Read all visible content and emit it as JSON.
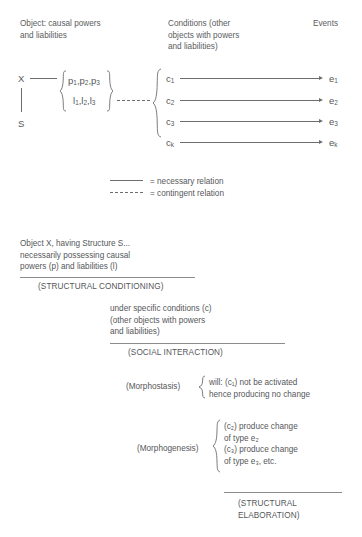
{
  "figure": {
    "headers": {
      "object": "Object: causal powers\nand liabilities",
      "conditions": "Conditions (other\nobjects with powers\nand liabilities)",
      "events": "Events"
    },
    "object_nodes": {
      "x": "X",
      "s": "S"
    },
    "powers_group": {
      "powers": [
        "p",
        "p",
        "p"
      ],
      "powers_subs": [
        "1",
        "2",
        "3"
      ],
      "liabilities": [
        "l",
        "l",
        "l"
      ],
      "liabilities_subs": [
        "1",
        "2",
        "3"
      ],
      "powers_line": "p₁,p₂,p₃",
      "liabilities_line": "l₁,l₂,l₃"
    },
    "rows": [
      {
        "condition": "c",
        "condition_sub": "1",
        "event": "e",
        "event_sub": "1"
      },
      {
        "condition": "c",
        "condition_sub": "2",
        "event": "e",
        "event_sub": "2"
      },
      {
        "condition": "c",
        "condition_sub": "3",
        "event": "e",
        "event_sub": "3"
      },
      {
        "condition": "c",
        "condition_sub": "k",
        "event": "e",
        "event_sub": "k"
      }
    ],
    "legend": [
      {
        "style": "solid",
        "label": "= necessary relation"
      },
      {
        "style": "dashed",
        "label": "= contingent relation"
      }
    ]
  },
  "stages": {
    "structural_conditioning": {
      "body": "Object X, having Structure S...\nnecessarily possessing causal\npowers (p) and liabilities (l)",
      "caption": "(STRUCTURAL CONDITIONING)"
    },
    "social_interaction": {
      "body": "under specific conditions (c)\n(other objects with powers\nand liabilities)",
      "caption": "(SOCIAL INTERACTION)"
    },
    "morphostasis": {
      "label": "(Morphostasis)",
      "body": "will: (c₁) not be activated\nhence producing no change"
    },
    "morphogenesis": {
      "label": "(Morphogenesis)",
      "body": "(c₂) produce change\nof type e₂\n(c₃) produce change\nof type e₃, etc."
    },
    "structural_elaboration": {
      "caption": "(STRUCTURAL\n     ELABORATION)"
    }
  }
}
